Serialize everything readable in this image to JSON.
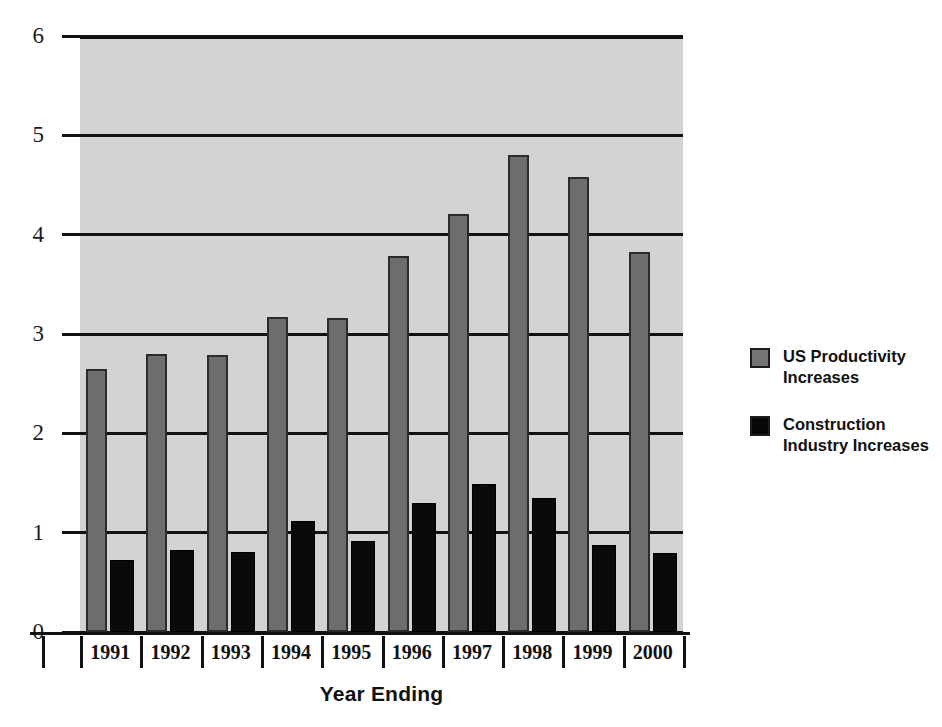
{
  "chart_data": {
    "type": "bar",
    "title": "",
    "xlabel": "Year Ending",
    "ylabel": "",
    "categories": [
      "1991",
      "1992",
      "1993",
      "1994",
      "1995",
      "1996",
      "1997",
      "1998",
      "1999",
      "2000"
    ],
    "series": [
      {
        "name": "US Productivity Increases",
        "color": "#6d6d6d",
        "values": [
          2.65,
          2.8,
          2.79,
          3.17,
          3.16,
          3.79,
          4.21,
          4.8,
          4.58,
          3.83
        ]
      },
      {
        "name": "Construction Industry Increases",
        "color": "#0a0a0a",
        "values": [
          0.72,
          0.83,
          0.81,
          1.12,
          0.92,
          1.3,
          1.49,
          1.35,
          0.88,
          0.8
        ]
      }
    ],
    "ylim": [
      0,
      6
    ],
    "yticks": [
      "0",
      "1",
      "2",
      "3",
      "4",
      "5",
      "6"
    ],
    "grid": true,
    "legend_position": "right",
    "plot_background": "#d3d3d3"
  },
  "legend": {
    "entries": [
      {
        "label": "US Productivity Increases"
      },
      {
        "label": "Construction Industry Increases"
      }
    ]
  },
  "axis": {
    "x_title": "Year Ending"
  }
}
